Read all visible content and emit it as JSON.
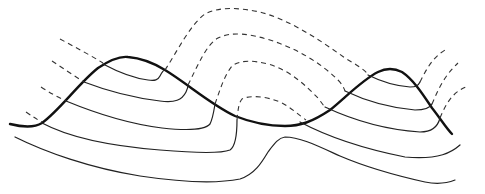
{
  "diagram": {
    "type": "line-drawing",
    "colors": {
      "background": "#ffffff",
      "line": "#111111"
    },
    "elements": {
      "profile_line": "thick undulating surface line with two crests",
      "solid_layers": 6,
      "dashed_projections": 8
    }
  }
}
